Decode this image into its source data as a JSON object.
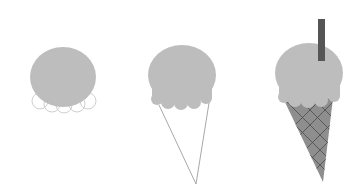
{
  "scene": {
    "description": "Three-step drawing of an ice cream cone",
    "background": "#ffffff",
    "colors": {
      "scoop": "#bdbdbd",
      "outline": "#c8c8c8",
      "cone_fill": "#8e8e8e",
      "cone_line": "#a0a0a0",
      "waffle_lines": "#4a4a4a",
      "stick": "#555555"
    },
    "steps": [
      {
        "label": "step-1",
        "name": "scoop-with-scallop-outlines"
      },
      {
        "label": "step-2",
        "name": "scoop-with-cone-outline"
      },
      {
        "label": "step-3",
        "name": "finished-cone-with-stick"
      }
    ]
  }
}
